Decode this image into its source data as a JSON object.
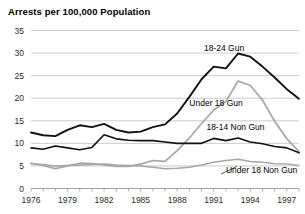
{
  "chart_data": {
    "type": "line",
    "title": "Arrests per 100,000 Population",
    "xlabel": "",
    "ylabel": "",
    "xlim": [
      1976,
      1998
    ],
    "ylim": [
      0,
      35
    ],
    "ytick_step": 5,
    "grid": true,
    "grid_axis": "y",
    "legend": "inline-labels",
    "x": [
      1976,
      1977,
      1978,
      1979,
      1980,
      1981,
      1982,
      1983,
      1984,
      1985,
      1986,
      1987,
      1988,
      1989,
      1990,
      1991,
      1992,
      1993,
      1994,
      1995,
      1996,
      1997,
      1998
    ],
    "yticks": [
      "0",
      "5",
      "10",
      "15",
      "20",
      "25",
      "30",
      "35"
    ],
    "xticks": [
      "1976",
      "1979",
      "1982",
      "1985",
      "1988",
      "1991",
      "1994",
      "1997"
    ],
    "series": [
      {
        "name": "18-24 Gun",
        "color": "#111111",
        "width": 1.9,
        "label_x": 1990.2,
        "label_y": 31.2,
        "values": [
          12.4,
          11.8,
          11.6,
          13.0,
          14.0,
          13.6,
          14.3,
          13.0,
          12.4,
          12.6,
          13.6,
          14.2,
          16.6,
          20.3,
          24.2,
          27.0,
          26.6,
          29.9,
          29.2,
          27.0,
          24.6,
          22.0,
          19.9
        ]
      },
      {
        "name": "Under 18 Gun",
        "color": "#a6a6a6",
        "width": 1.7,
        "label_x": 1989.0,
        "label_y": 18.9,
        "values": [
          5.6,
          5.1,
          4.4,
          5.0,
          5.6,
          5.5,
          5.2,
          4.9,
          4.9,
          5.4,
          6.2,
          6.0,
          8.4,
          11.2,
          14.4,
          17.4,
          19.3,
          23.8,
          22.8,
          19.6,
          14.9,
          11.0,
          8.2
        ]
      },
      {
        "name": "18-14 Non Gun",
        "color": "#111111",
        "width": 1.6,
        "label_x": 1990.4,
        "label_y": 13.7,
        "values": [
          9.0,
          8.7,
          9.4,
          9.0,
          8.6,
          9.1,
          11.9,
          11.0,
          10.7,
          10.6,
          10.6,
          10.3,
          10.0,
          10.0,
          10.0,
          11.1,
          10.6,
          11.2,
          10.3,
          9.9,
          9.3,
          9.0,
          7.9
        ]
      },
      {
        "name": "Under 18 Non Gun",
        "color": "#a6a6a6",
        "width": 1.5,
        "label_x": 1992.0,
        "label_y": 4.1,
        "values": [
          5.5,
          5.3,
          5.0,
          5.1,
          5.2,
          5.3,
          5.4,
          5.2,
          5.1,
          5.0,
          4.7,
          4.4,
          4.5,
          4.7,
          5.2,
          5.8,
          6.2,
          6.5,
          6.0,
          5.8,
          5.5,
          5.4,
          5.1
        ]
      }
    ],
    "annotations": [
      {
        "name": "under-18-non-gun-leader",
        "x1": 1992.9,
        "y1": 4.9,
        "x2": 1991.6,
        "y2": 3.2
      }
    ]
  }
}
